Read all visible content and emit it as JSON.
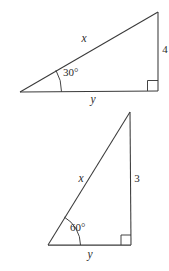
{
  "figure": {
    "background_color": "#ffffff",
    "stroke_color": "#3a3a3a",
    "text_color": "#2b2b2b"
  },
  "triangles": [
    {
      "id": "upper-triangle",
      "name": "upper-right-triangle",
      "angle_label": "30°",
      "hypotenuse_label": "x",
      "base_label": "y",
      "vertical_label": "4",
      "right_angle_marker": "right-angle-square",
      "vertices": {
        "left": [
          20,
          92
        ],
        "corner": [
          158,
          91
        ],
        "apex": [
          158,
          12
        ]
      }
    },
    {
      "id": "lower-triangle",
      "name": "lower-right-triangle",
      "angle_label": "60°",
      "hypotenuse_label": "x",
      "base_label": "y",
      "vertical_label": "3",
      "right_angle_marker": "right-angle-square",
      "vertices": {
        "left": [
          48,
          245
        ],
        "corner": [
          131,
          245
        ],
        "apex": [
          130,
          112
        ]
      }
    }
  ]
}
